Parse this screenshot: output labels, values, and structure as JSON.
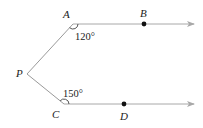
{
  "diagram": {
    "type": "geometry",
    "colors": {
      "line": "#9a9a9a",
      "point": "#111111",
      "text": "#222222",
      "background": "#ffffff"
    },
    "points": {
      "A": {
        "label": "A",
        "x": 73,
        "y": 24
      },
      "B": {
        "label": "B",
        "x": 144,
        "y": 24
      },
      "P": {
        "label": "P",
        "x": 27,
        "y": 74
      },
      "C": {
        "label": "C",
        "x": 64,
        "y": 104
      },
      "D": {
        "label": "D",
        "x": 124,
        "y": 104
      }
    },
    "angles": {
      "at_A": {
        "vertex": "A",
        "label": "120°"
      },
      "at_C": {
        "vertex": "C",
        "label": "150°"
      }
    },
    "rays": [
      {
        "from": "A",
        "through": "B",
        "arrow": true
      },
      {
        "from": "C",
        "through": "D",
        "arrow": true
      }
    ],
    "segments": [
      {
        "from": "P",
        "to": "A"
      },
      {
        "from": "P",
        "to": "C"
      }
    ]
  }
}
